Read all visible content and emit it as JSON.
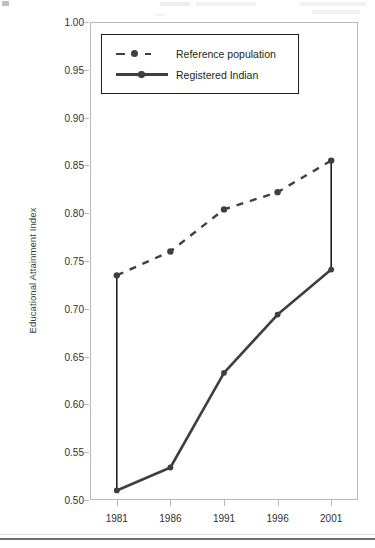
{
  "figure": {
    "y_axis_title": "Educational Attainment Index"
  },
  "legend": {
    "items": [
      {
        "label": "Reference population",
        "style": "dashed",
        "marker": "circle",
        "color": "#3f3f41"
      },
      {
        "label": "Registered Indian",
        "style": "solid",
        "marker": "circle",
        "color": "#3f3f41"
      }
    ]
  },
  "chart_data": {
    "type": "line",
    "title": "",
    "subtitle": "",
    "xlabel": "",
    "ylabel": "Educational Attainment Index",
    "categories": [
      "1981",
      "1986",
      "1991",
      "1996",
      "2001"
    ],
    "x": [
      1981,
      1986,
      1991,
      1996,
      2001
    ],
    "xlim": [
      1978.5,
      2003.5
    ],
    "ylim": [
      0.5,
      1.0
    ],
    "ytick_labels": [
      "0.50",
      "0.55",
      "0.60",
      "0.65",
      "0.70",
      "0.75",
      "0.80",
      "0.85",
      "0.90",
      "0.95",
      "1.00"
    ],
    "ytick_values": [
      0.5,
      0.55,
      0.6,
      0.65,
      0.7,
      0.75,
      0.8,
      0.85,
      0.9,
      0.95,
      1.0
    ],
    "xtick_labels": [
      "1981",
      "1986",
      "1991",
      "1996",
      "2001"
    ],
    "grid": false,
    "legend_position": "top-left-inside",
    "annotations": [
      {
        "type": "gap-connector",
        "x": 1981,
        "from": 0.51,
        "to": 0.735
      },
      {
        "type": "gap-connector",
        "x": 2001,
        "from": 0.741,
        "to": 0.855
      }
    ],
    "series": [
      {
        "name": "Reference population",
        "style": "dashed",
        "color": "#3f3f41",
        "values": [
          0.735,
          0.76,
          0.804,
          0.822,
          0.855
        ]
      },
      {
        "name": "Registered Indian",
        "style": "solid",
        "color": "#3f3f41",
        "values": [
          0.51,
          0.534,
          0.633,
          0.694,
          0.741
        ]
      }
    ]
  }
}
